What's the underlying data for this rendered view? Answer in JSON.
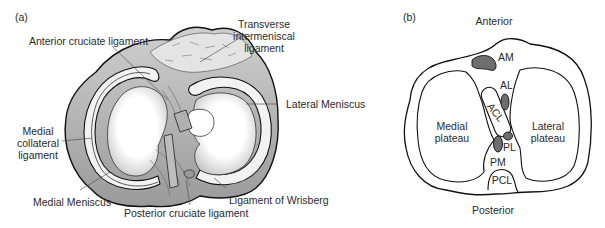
{
  "panel_a": {
    "tag": "(a)",
    "labels": {
      "acl": "Anterior cruciate ligament",
      "transverse": [
        "Transverse",
        "intermeniscal",
        "ligament"
      ],
      "lateral_meniscus": "Lateral Meniscus",
      "mcl": [
        "Medial",
        "collateral",
        "ligament"
      ],
      "medial_meniscus": "Medial Meniscus",
      "pcl": "Posterior cruciate ligament",
      "wrisberg": "Ligament of Wrisberg"
    }
  },
  "panel_b": {
    "tag": "(b)",
    "labels": {
      "anterior": "Anterior",
      "posterior": "Posterior",
      "medial_plateau": [
        "Medial",
        "plateau"
      ],
      "lateral_plateau": [
        "Lateral",
        "plateau"
      ],
      "am": "AM",
      "al": "AL",
      "acl": "ACL",
      "pl": "PL",
      "pm": "PM",
      "pcl": "PCL"
    },
    "colors": {
      "insertion_fill": "#6e6e6e",
      "outline": "#1a1a1a"
    }
  }
}
